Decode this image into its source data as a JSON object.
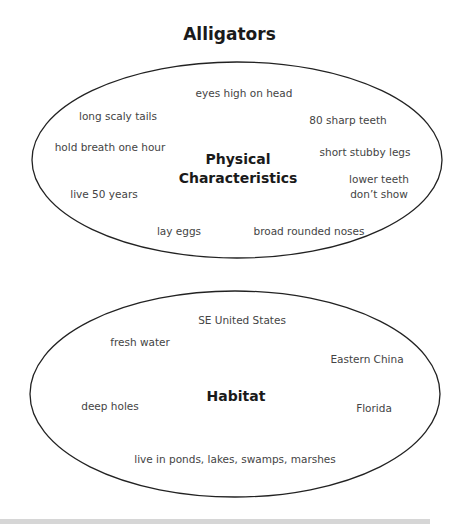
{
  "title": "Alligators",
  "colors": {
    "stroke": "#222222",
    "text": "#444444",
    "heading": "#1a1a1a",
    "bottom_bar": "#d6d6d6"
  },
  "physical": {
    "center_line1": "Physical",
    "center_line2": "Characteristics",
    "items": [
      "eyes high on head",
      "long scaly tails",
      "80 sharp teeth",
      "hold breath one hour",
      "short stubby legs",
      "lower teeth",
      "don’t show",
      "live 50 years",
      "lay eggs",
      "broad rounded noses"
    ]
  },
  "habitat": {
    "center": "Habitat",
    "items": [
      "SE United States",
      "fresh water",
      "Eastern China",
      "deep holes",
      "Florida",
      "live in ponds, lakes, swamps, marshes"
    ]
  }
}
